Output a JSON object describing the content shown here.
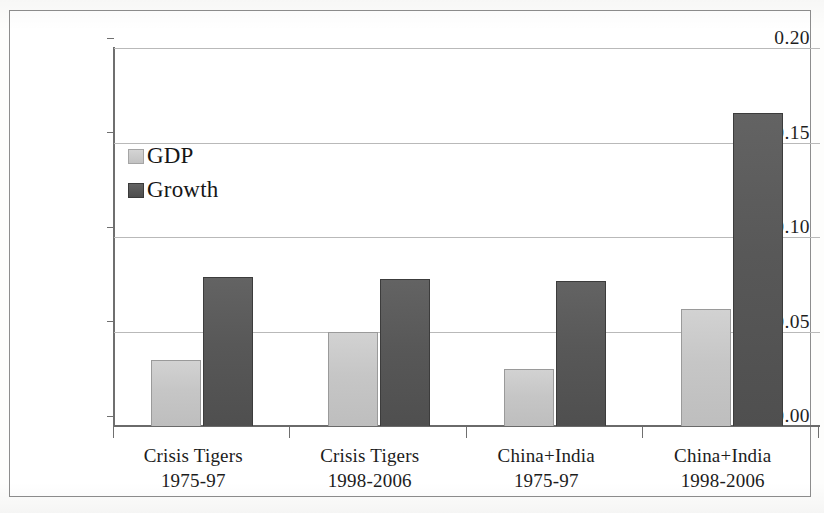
{
  "chart_data": {
    "type": "bar",
    "title": "",
    "xlabel": "",
    "ylabel": "",
    "ylim": [
      0.0,
      0.2
    ],
    "grid": true,
    "legend_position": "inside-top-left",
    "ytick_labels": [
      "0.20",
      "0.15",
      "0.10",
      "0.05",
      "0.00"
    ],
    "ytick_values": [
      0.2,
      0.15,
      0.1,
      0.05,
      0.0
    ],
    "categories": [
      "Crisis Tigers 1975-97",
      "Crisis Tigers 1998-2006",
      "China+India 1975-97",
      "China+India 1998-2006"
    ],
    "category_lines": [
      {
        "line1": "Crisis Tigers",
        "line2": "1975-97"
      },
      {
        "line1": "Crisis Tigers",
        "line2": "1998-2006"
      },
      {
        "line1": "China+India",
        "line2": "1975-97"
      },
      {
        "line1": "China+India",
        "line2": "1998-2006"
      }
    ],
    "series": [
      {
        "name": "GDP",
        "color": "#c6c6c6",
        "values": [
          0.035,
          0.05,
          0.03,
          0.062
        ]
      },
      {
        "name": "Growth",
        "color": "#585858",
        "values": [
          0.079,
          0.078,
          0.077,
          0.166
        ]
      }
    ]
  },
  "legend": {
    "items": [
      {
        "label": "GDP",
        "color": "#c6c6c6"
      },
      {
        "label": "Growth",
        "color": "#585858"
      }
    ]
  },
  "axis": {
    "y_labels": [
      "0.20",
      "0.15",
      "0.10",
      "0.05",
      "0.00"
    ]
  }
}
